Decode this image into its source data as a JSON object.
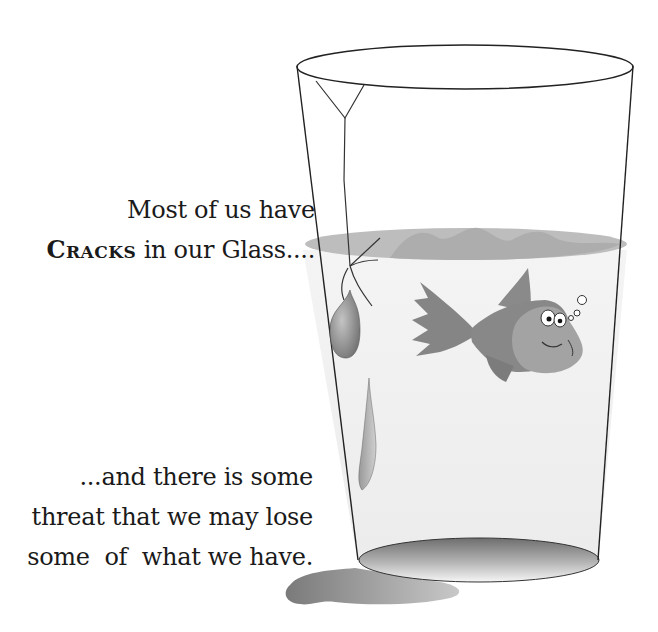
{
  "caption_top": {
    "line1": "Most of us have",
    "line2_emphasis": "Cracks",
    "line2_rest": " in our Glass...."
  },
  "caption_bottom": {
    "line1": "...and there is some",
    "line2": "threat that we may lose",
    "line3": "some  of  what we have."
  },
  "illustration": {
    "subject": "glass of water with fish, crack, leaking drops and spill puddle",
    "colors": {
      "outline": "#222222",
      "water_surface": "#b8b8b8",
      "water_body": "#f1f1f1",
      "fish_body": "#8a8a8a",
      "fish_face": "#a6a6a6",
      "puddle": "#8c8c8c"
    }
  }
}
